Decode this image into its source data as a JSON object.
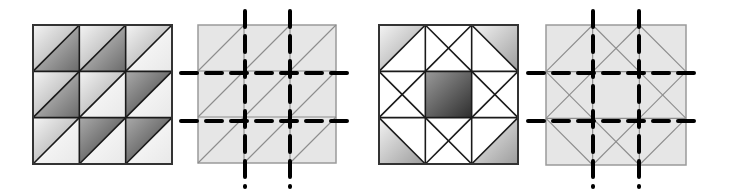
{
  "figure": {
    "colors": {
      "background": "#ffffff",
      "outline": "#1a1a1a",
      "light_panel_fill": "#e6e6e6",
      "light_panel_lines": "#8c8c8c",
      "dashed_lines": "#000000",
      "shade_light_start": "#f2f2f2",
      "shade_light_end": "#9a9a9a",
      "shade_dark_start": "#b0b0b0",
      "shade_dark_end": "#3a3a3a",
      "white": "#ffffff"
    },
    "panels": [
      {
        "id": "panel-1",
        "type": "shaded-half-square-triangles",
        "bounds": {
          "x": 33,
          "y": 25,
          "size": 139
        },
        "grid": 3,
        "cells": [
          [
            {
              "upper": "light",
              "lower": "mid"
            },
            {
              "upper": "light",
              "lower": "mid"
            },
            {
              "upper": "light",
              "lower": "white"
            }
          ],
          [
            {
              "upper": "light",
              "lower": "mid"
            },
            {
              "upper": "light",
              "lower": "white"
            },
            {
              "upper": "dark",
              "lower": "white"
            }
          ],
          [
            {
              "upper": "light",
              "lower": "white"
            },
            {
              "upper": "dark",
              "lower": "white"
            },
            {
              "upper": "dark",
              "lower": "white"
            }
          ]
        ]
      },
      {
        "id": "panel-2",
        "type": "grid-with-cut-lines",
        "bounds": {
          "x": 198,
          "y": 25,
          "size": 138
        },
        "pattern": "diagonals",
        "cut_lines": {
          "vertical_x": [
            245,
            290
          ],
          "horizontal_y": [
            73,
            121
          ],
          "v_extent": [
            11,
            187
          ],
          "h_extent": [
            181,
            350
          ]
        }
      },
      {
        "id": "panel-3",
        "type": "shaded-star-block",
        "bounds": {
          "x": 379,
          "y": 25,
          "size": 139
        },
        "grid": 3
      },
      {
        "id": "panel-4",
        "type": "grid-with-cut-lines",
        "bounds": {
          "x": 546,
          "y": 25,
          "size": 140
        },
        "pattern": "star",
        "cut_lines": {
          "vertical_x": [
            593,
            639
          ],
          "horizontal_y": [
            73,
            121
          ],
          "v_extent": [
            11,
            187
          ],
          "h_extent": [
            528,
            700
          ]
        }
      }
    ]
  }
}
